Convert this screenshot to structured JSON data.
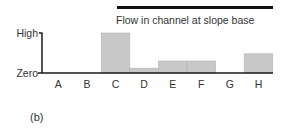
{
  "chart_data": {
    "type": "bar",
    "title": "Flow in channel at slope base",
    "panel_label": "(b)",
    "categories": [
      "A",
      "B",
      "C",
      "D",
      "E",
      "F",
      "G",
      "H"
    ],
    "values": [
      0,
      0,
      1.0,
      0.12,
      0.3,
      0.3,
      0,
      0.48
    ],
    "value_scale": "relative (Zero to High)",
    "ylim": [
      0,
      1
    ],
    "y_tick_labels": [
      "Zero",
      "High"
    ],
    "xlabel": "",
    "ylabel": "",
    "grid": false,
    "colors": {
      "bar": "#c8c8c8",
      "bar_edge": "#b4b4b4",
      "axis": "#1a1a1a",
      "title_bar": "#111111"
    }
  }
}
